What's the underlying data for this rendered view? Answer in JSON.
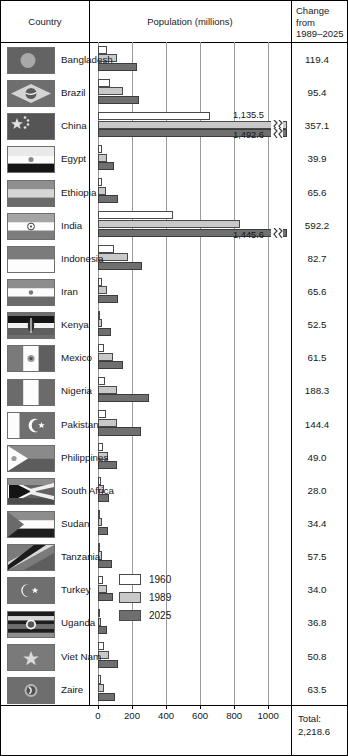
{
  "header": {
    "country": "Country",
    "population": "Population (millions)",
    "change_line1": "Change",
    "change_line2": "from",
    "change_line3": "1989–2025"
  },
  "legend": {
    "position": "inside-plot-bottom-right",
    "items": [
      {
        "label": "1960",
        "color": "#ffffff",
        "name": "legend-swatch-1960"
      },
      {
        "label": "1989",
        "color": "#c9c9c9",
        "name": "legend-swatch-1989"
      },
      {
        "label": "2025",
        "color": "#6f6f6f",
        "name": "legend-swatch-2025"
      }
    ]
  },
  "axis": {
    "ticks": [
      "0",
      "200",
      "400",
      "600",
      "800",
      "1000"
    ],
    "min": 0,
    "max": 1000
  },
  "total": {
    "label": "Total:",
    "value": "2,218.6"
  },
  "chart_data": {
    "type": "bar",
    "orientation": "horizontal",
    "title": "Population (millions)",
    "xlabel": "Population (millions)",
    "ylabel": "Country",
    "xlim": [
      0,
      1000
    ],
    "grid": true,
    "legend_position": "inside-bottom-right",
    "categories": [
      "Bangladesh",
      "Brazil",
      "China",
      "Egypt",
      "Ethiopia",
      "India",
      "Indonesia",
      "Iran",
      "Kenya",
      "Mexico",
      "Nigeria",
      "Pakistan",
      "Philippines",
      "South Africa",
      "Sudan",
      "Tanzania",
      "Turkey",
      "Uganda",
      "Viet Nam",
      "Zaire"
    ],
    "series": [
      {
        "name": "1960",
        "color": "#ffffff",
        "values": [
          51.4,
          72.6,
          657.5,
          25.9,
          23.4,
          442.3,
          96.2,
          21.6,
          8.1,
          36.9,
          42.3,
          49.9,
          27.9,
          17.4,
          11.2,
          10.1,
          27.5,
          7.3,
          34.7,
          15.9
        ]
      },
      {
        "name": "1989",
        "color": "#c9c9c9",
        "values": [
          110.1,
          147.3,
          1135.5,
          51.7,
          49.5,
          832.5,
          178.2,
          54.3,
          24.0,
          86.2,
          109.2,
          110.4,
          60.1,
          34.9,
          24.5,
          25.6,
          54.9,
          17.8,
          66.8,
          34.5
        ]
      },
      {
        "name": "2025",
        "color": "#6f6f6f",
        "values": [
          229.5,
          242.7,
          1492.6,
          91.6,
          115.1,
          1424.7,
          260.9,
          119.9,
          76.5,
          147.7,
          297.5,
          254.8,
          109.1,
          62.9,
          58.9,
          83.1,
          88.9,
          54.6,
          117.6,
          98.0
        ]
      }
    ],
    "break_labels": [
      {
        "category": "China",
        "series": "1989",
        "value": "1,135.5"
      },
      {
        "category": "China",
        "series": "2025",
        "value": "1,492.6"
      },
      {
        "category": "India",
        "series": "2025",
        "value": "1,445.6"
      }
    ]
  },
  "rows": [
    {
      "country": "Bangladesh",
      "change": "119.4",
      "flag": "bangladesh-flag"
    },
    {
      "country": "Brazil",
      "change": "95.4",
      "flag": "brazil-flag"
    },
    {
      "country": "China",
      "change": "357.1",
      "flag": "china-flag"
    },
    {
      "country": "Egypt",
      "change": "39.9",
      "flag": "egypt-flag"
    },
    {
      "country": "Ethiopia",
      "change": "65.6",
      "flag": "ethiopia-flag"
    },
    {
      "country": "India",
      "change": "592.2",
      "flag": "india-flag"
    },
    {
      "country": "Indonesia",
      "change": "82.7",
      "flag": "indonesia-flag"
    },
    {
      "country": "Iran",
      "change": "65.6",
      "flag": "iran-flag"
    },
    {
      "country": "Kenya",
      "change": "52.5",
      "flag": "kenya-flag"
    },
    {
      "country": "Mexico",
      "change": "61.5",
      "flag": "mexico-flag"
    },
    {
      "country": "Nigeria",
      "change": "188.3",
      "flag": "nigeria-flag"
    },
    {
      "country": "Pakistan",
      "change": "144.4",
      "flag": "pakistan-flag"
    },
    {
      "country": "Philippines",
      "change": "49.0",
      "flag": "philippines-flag"
    },
    {
      "country": "South Africa",
      "change": "28.0",
      "flag": "south-africa-flag"
    },
    {
      "country": "Sudan",
      "change": "34.4",
      "flag": "sudan-flag"
    },
    {
      "country": "Tanzania",
      "change": "57.5",
      "flag": "tanzania-flag"
    },
    {
      "country": "Turkey",
      "change": "34.0",
      "flag": "turkey-flag"
    },
    {
      "country": "Uganda",
      "change": "36.8",
      "flag": "uganda-flag"
    },
    {
      "country": "Viet Nam",
      "change": "50.8",
      "flag": "viet-nam-flag"
    },
    {
      "country": "Zaire",
      "change": "63.5",
      "flag": "zaire-flag"
    }
  ]
}
